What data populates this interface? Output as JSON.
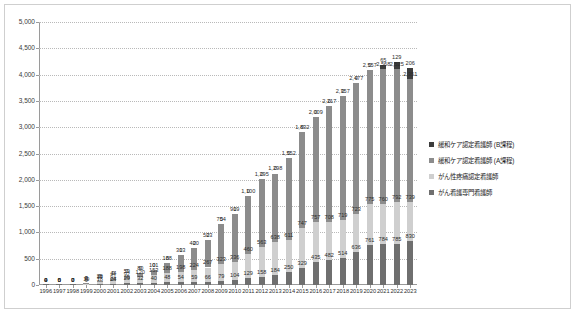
{
  "chart_data": {
    "type": "bar",
    "stacked": true,
    "title": "",
    "subtitle": "",
    "xlabel": "",
    "ylabel": "",
    "ylim": [
      0,
      5000
    ],
    "yticks": [
      0,
      500,
      1000,
      1500,
      2000,
      2500,
      3000,
      3500,
      4000,
      4500,
      5000
    ],
    "ytick_labels": [
      "0",
      "500",
      "1,000",
      "1,500",
      "2,000",
      "2,500",
      "3,000",
      "3,500",
      "4,000",
      "4,500",
      "5,000"
    ],
    "grid": true,
    "legend_position": "right",
    "categories": [
      "1996",
      "1997",
      "1998",
      "1999",
      "2000",
      "2001",
      "2002",
      "2003",
      "2004",
      "2005",
      "2006",
      "2007",
      "2008",
      "2009",
      "2010",
      "2011",
      "2012",
      "2013",
      "2014",
      "2015",
      "2016",
      "2017",
      "2018",
      "2019",
      "2020",
      "2021",
      "2022",
      "2023"
    ],
    "series": [
      {
        "name": "がん看護専門看護師",
        "color": "#6f6f6f",
        "values": [
          4,
          5,
          7,
          9,
          18,
          24,
          29,
          32,
          40,
          48,
          54,
          59,
          66,
          79,
          104,
          129,
          158,
          184,
          250,
          329,
          435,
          482,
          514,
          636,
          761,
          784,
          785,
          830
        ],
        "labels": [
          "4",
          "5",
          "7",
          "9",
          "18",
          "24",
          "29",
          "32",
          "40",
          "48",
          "54",
          "59",
          "66",
          "79",
          "104",
          "129",
          "158",
          "184",
          "250",
          "329",
          "435",
          "482",
          "514",
          "636",
          "761",
          "784",
          "785",
          "830"
        ]
      },
      {
        "name": "がん性疼痛認定看護師",
        "color": "#cfcfcf",
        "values": [
          0,
          0,
          0,
          19,
          37,
          61,
          92,
          120,
          153,
          188,
          198,
          224,
          267,
          323,
          336,
          460,
          563,
          638,
          611,
          747,
          757,
          708,
          719,
          723,
          775,
          760,
          792,
          739
        ],
        "labels": [
          "0",
          "0",
          "0",
          "19",
          "37",
          "61",
          "92",
          "120",
          "153",
          "188",
          "198",
          "224",
          "267",
          "323",
          "336",
          "460",
          "563",
          "638",
          "611",
          "747",
          "757",
          "708",
          "719",
          "723",
          "775",
          "760",
          "792",
          "739"
        ]
      },
      {
        "name": "緩和ケア認定看護師 (A課程)",
        "color": "#8c8c8c",
        "values": [
          0,
          0,
          0,
          8,
          26,
          44,
          59,
          80,
          101,
          188,
          313,
          420,
          523,
          754,
          919,
          1100,
          1295,
          1298,
          1552,
          1832,
          2009,
          2217,
          2357,
          2477,
          2557,
          2568,
          2525,
          2351
        ],
        "labels": [
          "0",
          "0",
          "0",
          "8",
          "26",
          "44",
          "59",
          "80",
          "101",
          "188",
          "313",
          "420",
          "523",
          "754",
          "919",
          "1,100",
          "1,295",
          "1,298",
          "1,552",
          "1,832",
          "2,009",
          "2,217",
          "2,357",
          "2,477",
          "2,557",
          "2,568",
          "2,525",
          "2,351"
        ]
      },
      {
        "name": "緩和ケア認定看護師 (B課程)",
        "color": "#3c3c3c",
        "values": [
          0,
          0,
          0,
          0,
          0,
          0,
          0,
          0,
          0,
          0,
          0,
          0,
          0,
          0,
          0,
          0,
          0,
          0,
          0,
          0,
          0,
          0,
          0,
          0,
          0,
          65,
          129,
          206
        ],
        "labels": [
          "0",
          "0",
          "0",
          "0",
          "0",
          "0",
          "0",
          "0",
          "0",
          "0",
          "0",
          "0",
          "0",
          "0",
          "0",
          "0",
          "0",
          "0",
          "0",
          "0",
          "0",
          "0",
          "0",
          "0",
          "0",
          "65",
          "129",
          "206"
        ]
      }
    ]
  },
  "legend": {
    "items": [
      {
        "label": "緩和ケア認定看護師 (B課程)",
        "color": "#3c3c3c"
      },
      {
        "label": "緩和ケア認定看護師 (A課程)",
        "color": "#8c8c8c"
      },
      {
        "label": "がん性疼痛認定看護師",
        "color": "#cfcfcf"
      },
      {
        "label": "がん看護専門看護師",
        "color": "#6f6f6f"
      }
    ]
  }
}
